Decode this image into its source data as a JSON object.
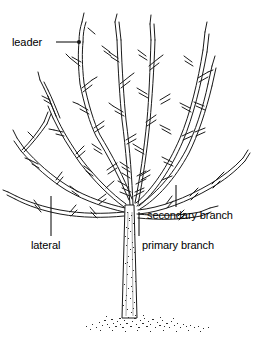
{
  "figure": {
    "type": "botanical-line-drawing",
    "width": 253,
    "height": 342,
    "background_color": "#ffffff",
    "line_color": "#1a1a1a",
    "stipple_color": "#333333"
  },
  "labels": {
    "leader": "leader",
    "lateral": "lateral",
    "primary_branch": "primary branch",
    "secondary_branch": "secondary branch"
  },
  "callouts": [
    {
      "id": "leader",
      "text": "leader",
      "text_x": 12,
      "text_y": 36,
      "line_type": "horizontal",
      "line_x1": 56,
      "line_y1": 42,
      "line_x2": 78,
      "line_y2": 42,
      "node_dot": true,
      "node_x": 79,
      "node_y": 42
    },
    {
      "id": "lateral",
      "text": "lateral",
      "text_x": 31,
      "text_y": 239,
      "line_type": "vertical",
      "line_x1": 51,
      "line_y1": 196,
      "line_x2": 51,
      "line_y2": 236,
      "node_dot": false
    },
    {
      "id": "primary-branch",
      "text": "primary branch",
      "text_x": 142,
      "text_y": 239,
      "line_type": "vertical",
      "line_x1": 139,
      "line_y1": 212,
      "line_x2": 139,
      "line_y2": 236,
      "node_dot": false
    },
    {
      "id": "secondary-branch",
      "text": "secondary branch",
      "text_x": 147,
      "text_y": 209,
      "line_type": "vertical",
      "line_x1": 176,
      "line_y1": 185,
      "line_x2": 176,
      "line_y2": 207,
      "node_dot": false
    }
  ],
  "tree": {
    "trunk": {
      "top_y": 205,
      "base_y": 318,
      "top_left_x": 125,
      "top_right_x": 134,
      "base_left_x": 122,
      "base_right_x": 137,
      "bark_texture": "stipple"
    },
    "crotch": {
      "x": 130,
      "y": 205
    },
    "ground": {
      "center_x": 147,
      "y": 322,
      "half_width": 63,
      "texture": "stipple"
    }
  }
}
